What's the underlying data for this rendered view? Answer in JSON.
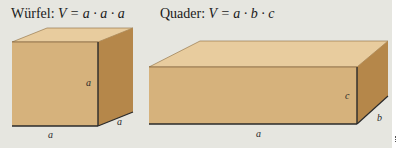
{
  "cube": {
    "name": "Würfel:",
    "formula": "V = a · a · a",
    "labels": {
      "height": "a",
      "depth": "a",
      "width": "a"
    }
  },
  "cuboid": {
    "name": "Quader:",
    "formula": "V = a · b · c",
    "labels": {
      "height": "c",
      "depth": "b",
      "width": "a"
    }
  },
  "colors": {
    "background": "#e6e6e0",
    "front": "#d6b27c",
    "top": "#e8cc9e",
    "side": "#b5874a",
    "edge": "#2a2a2a"
  }
}
